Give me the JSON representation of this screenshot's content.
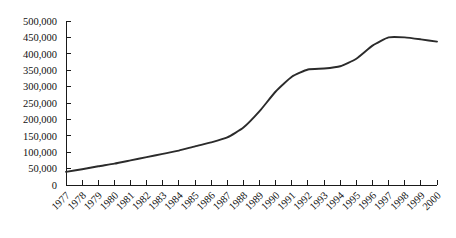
{
  "chart_data": {
    "type": "line",
    "title": "",
    "subtitle": "",
    "xlabel": "",
    "ylabel": "",
    "grid": false,
    "legend": false,
    "legend_position": "none",
    "line_color": "#2b2b2b",
    "background_color": "#ffffff",
    "axis_color": "#1a1a1a",
    "ylim": [
      0,
      500000
    ],
    "ytick_step": 50000,
    "ytick_labels": [
      "0",
      "50,000",
      "100,000",
      "150,000",
      "200,000",
      "250,000",
      "300,000",
      "350,000",
      "400,000",
      "450,000",
      "500,000"
    ],
    "ytick_values": [
      0,
      50000,
      100000,
      150000,
      200000,
      250000,
      300000,
      350000,
      400000,
      450000,
      500000
    ],
    "categories": [
      "1977",
      "1978",
      "1979",
      "1980",
      "1981",
      "1982",
      "1983",
      "1984",
      "1985",
      "1986",
      "1987",
      "1988",
      "1989",
      "1990",
      "1991",
      "1992",
      "1993",
      "1994",
      "1995",
      "1996",
      "1997",
      "1998",
      "1999",
      "2000"
    ],
    "xtick_rotation": 45,
    "series": [
      {
        "name": "series-1",
        "values": [
          40000,
          48000,
          57000,
          65000,
          75000,
          85000,
          95000,
          105000,
          118000,
          130000,
          145000,
          175000,
          225000,
          285000,
          330000,
          352000,
          355000,
          362000,
          385000,
          425000,
          450000,
          450000,
          444000,
          437000
        ]
      }
    ]
  }
}
